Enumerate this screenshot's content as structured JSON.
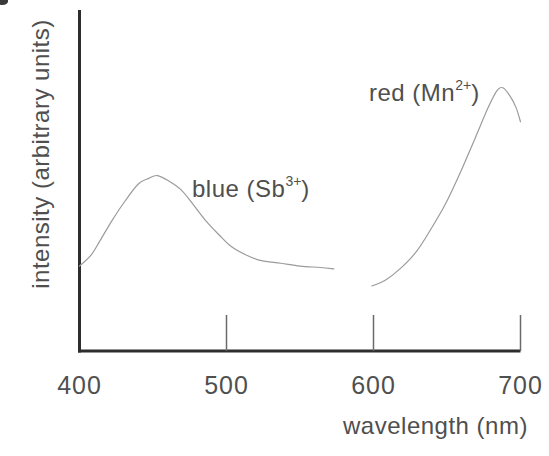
{
  "figure": {
    "background": "#ffffff",
    "axis_color": "#2d2d2d",
    "tick_color": "#6a6a6a",
    "curve_color": "#9b9b9b",
    "text_color": "#4f4f4f"
  },
  "chart_data": {
    "type": "line",
    "title": "",
    "xlabel": "wavelength (nm)",
    "ylabel": "intensity (arbitrary units)",
    "xlim": [
      400,
      700
    ],
    "ylim": [
      0,
      1
    ],
    "grid": false,
    "x_ticks": [
      {
        "value": 400,
        "label": "400",
        "mark": false
      },
      {
        "value": 500,
        "label": "500",
        "mark": true
      },
      {
        "value": 600,
        "label": "600",
        "mark": true
      },
      {
        "value": 700,
        "label": "700",
        "mark": true
      }
    ],
    "series": [
      {
        "name": "blue (Sb3+)",
        "label_parts": {
          "prefix": "blue (Sb",
          "sup": "3+",
          "suffix": ")"
        },
        "points": [
          [
            400,
            0.3
          ],
          [
            408,
            0.34
          ],
          [
            414,
            0.39
          ],
          [
            422,
            0.46
          ],
          [
            431,
            0.53
          ],
          [
            440,
            0.59
          ],
          [
            447,
            0.61
          ],
          [
            453,
            0.62
          ],
          [
            461,
            0.6
          ],
          [
            469,
            0.57
          ],
          [
            477,
            0.52
          ],
          [
            486,
            0.46
          ],
          [
            495,
            0.41
          ],
          [
            503,
            0.37
          ],
          [
            513,
            0.34
          ],
          [
            523,
            0.32
          ],
          [
            537,
            0.31
          ],
          [
            550,
            0.3
          ],
          [
            564,
            0.295
          ],
          [
            573,
            0.29
          ]
        ]
      },
      {
        "name": "red (Mn2+)",
        "label_parts": {
          "prefix": "red (Mn",
          "sup": "2+",
          "suffix": ")"
        },
        "points": [
          [
            599,
            0.23
          ],
          [
            608,
            0.25
          ],
          [
            618,
            0.29
          ],
          [
            629,
            0.35
          ],
          [
            639,
            0.43
          ],
          [
            649,
            0.52
          ],
          [
            659,
            0.63
          ],
          [
            669,
            0.75
          ],
          [
            678,
            0.86
          ],
          [
            684,
            0.92
          ],
          [
            688,
            0.93
          ],
          [
            693,
            0.9
          ],
          [
            697,
            0.86
          ],
          [
            700,
            0.81
          ]
        ]
      }
    ]
  }
}
